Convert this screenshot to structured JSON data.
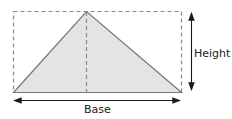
{
  "diagram": {
    "labels": {
      "height": "Height",
      "base": "Base"
    },
    "colors": {
      "fill": "#e4e4e4",
      "stroke": "#777777",
      "dash": "#8a8a8a",
      "arrow": "#1a1a1a",
      "text": "#222222"
    },
    "shapes": {
      "bounding_rectangle": {
        "x": 13,
        "y": 11,
        "width": 168,
        "height": 81,
        "style": "dashed"
      },
      "triangle": {
        "points": [
          [
            13,
            92
          ],
          [
            86,
            11
          ],
          [
            181,
            92
          ]
        ],
        "style": "filled"
      },
      "altitude": {
        "x": 86,
        "y1": 11,
        "y2": 92,
        "style": "dashed"
      },
      "base_arrow": {
        "x1": 13,
        "x2": 181,
        "y": 100,
        "style": "double-headed"
      },
      "height_arrow": {
        "x": 191,
        "y1": 12,
        "y2": 91,
        "style": "double-headed"
      }
    }
  }
}
